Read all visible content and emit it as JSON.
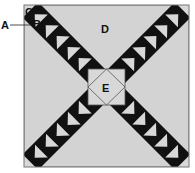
{
  "diagram": {
    "type": "quilt-block",
    "colors": {
      "background": "#d3d3d3",
      "dark": "#111111",
      "light": "#d8d8d8",
      "outline": "#666666"
    },
    "labels": {
      "A": "A",
      "B": "B",
      "C": "C",
      "D": "D",
      "E": "E"
    },
    "arms": 4,
    "geese_per_arm": 7
  }
}
